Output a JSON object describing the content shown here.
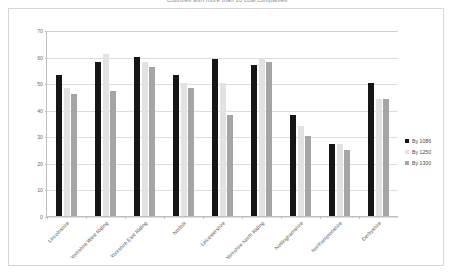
{
  "chart_data": {
    "type": "bar",
    "title": "Counties with more than 10 coal companies",
    "xlabel": "",
    "ylabel": "",
    "ylim": [
      0,
      70
    ],
    "yticks": [
      0,
      10,
      20,
      30,
      40,
      50,
      60,
      70
    ],
    "grid": true,
    "legend_position": "right",
    "categories": [
      "Lincolnshire",
      "Yorkshire West Riding",
      "Yorkshire East Riding",
      "Norfolk",
      "Leicestershire",
      "Yorkshire North Riding",
      "Nottinghamshire",
      "Northamptonshire",
      "Derbyshire"
    ],
    "series": [
      {
        "name": "By 1086",
        "color": "#161616",
        "values": [
          53,
          58,
          60,
          53,
          59,
          57,
          38,
          27,
          50
        ]
      },
      {
        "name": "By 1250",
        "color": "#e2e2e2",
        "values": [
          48,
          61,
          58,
          50,
          50,
          59,
          34,
          27,
          44
        ]
      },
      {
        "name": "By 1300",
        "color": "#a5a5a5",
        "values": [
          46,
          47,
          56,
          48,
          38,
          58,
          30,
          25,
          44
        ]
      }
    ]
  },
  "legend": {
    "items": [
      {
        "label": "By 1086"
      },
      {
        "label": "By 1250"
      },
      {
        "label": "By 1300"
      }
    ]
  }
}
